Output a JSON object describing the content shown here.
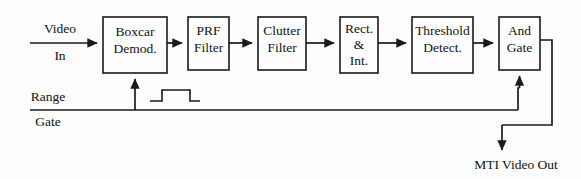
{
  "diagram": {
    "type": "block-diagram",
    "stroke_color": "#1a1a1a",
    "background_color": "#fdfdfb",
    "blocks": [
      {
        "id": "boxcar",
        "lines": [
          "Boxcar",
          "Demod."
        ]
      },
      {
        "id": "prf",
        "lines": [
          "PRF",
          "Filter"
        ]
      },
      {
        "id": "clutter",
        "lines": [
          "Clutter",
          "Filter"
        ]
      },
      {
        "id": "rect",
        "lines": [
          "Rect.",
          "&",
          "Int."
        ]
      },
      {
        "id": "threshold",
        "lines": [
          "Threshold",
          "Detect."
        ]
      },
      {
        "id": "andgate",
        "lines": [
          "And",
          "Gate"
        ]
      }
    ],
    "io": {
      "input_video_top": "Video",
      "input_video_bottom": "In",
      "input_range_top": "Range",
      "input_range_bottom": "Gate",
      "output": "MTI Video Out"
    },
    "annotations": {
      "range_gate_pulse": "gate-pulse-waveform"
    }
  }
}
